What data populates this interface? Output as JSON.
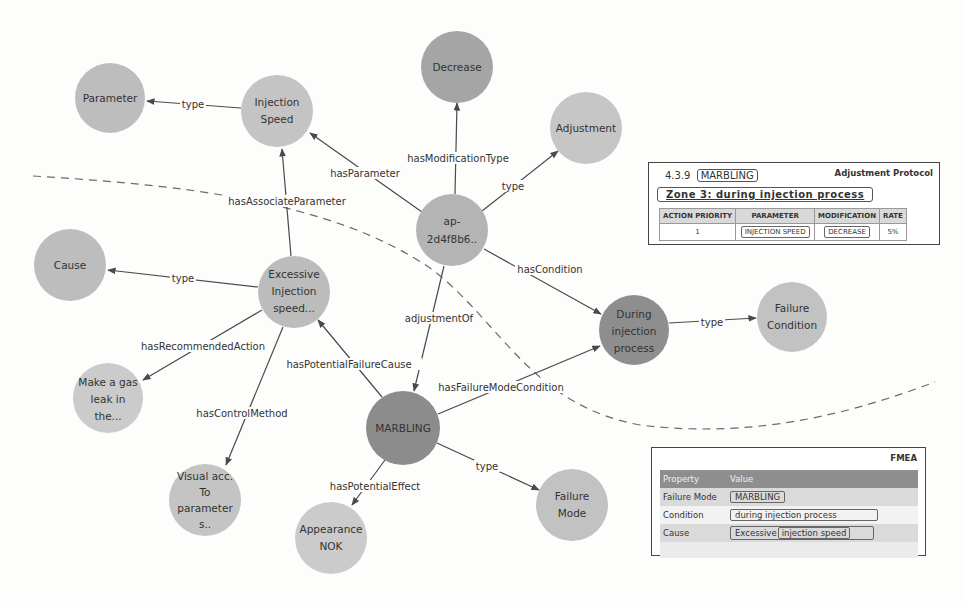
{
  "colors": {
    "node_light": "#c4c4c4",
    "node_medium": "#a9a9a9",
    "node_dark": "#8b8b8b",
    "edge": "#4a4a4a",
    "panel_header": "#8e8e8e"
  },
  "nodes": {
    "parameter": {
      "lines": [
        "Parameter"
      ]
    },
    "injection_speed": {
      "lines": [
        "Injection",
        "Speed"
      ]
    },
    "decrease": {
      "lines": [
        "Decrease"
      ]
    },
    "adjustment": {
      "lines": [
        "Adjustment"
      ]
    },
    "ap": {
      "lines": [
        "ap-",
        "2d4f8b6.."
      ]
    },
    "cause": {
      "lines": [
        "Cause"
      ]
    },
    "excessive": {
      "lines": [
        "Excessive",
        "Injection",
        "speed..."
      ]
    },
    "during": {
      "lines": [
        "During",
        "injection",
        "process"
      ]
    },
    "failure_condition": {
      "lines": [
        "Failure",
        "Condition"
      ]
    },
    "make_gas": {
      "lines": [
        "Make a gas",
        "leak in",
        "the..."
      ]
    },
    "marbling": {
      "lines": [
        "MARBLING"
      ]
    },
    "visual": {
      "lines": [
        "Visual acc.",
        "To",
        "parameter",
        "s.."
      ]
    },
    "appearance": {
      "lines": [
        "Appearance",
        "NOK"
      ]
    },
    "failure_mode": {
      "lines": [
        "Failure",
        "Mode"
      ]
    }
  },
  "edges": {
    "injspeed_type": "type",
    "ap_hasParameter": "hasParameter",
    "ap_hasModificationType": "hasModificationType",
    "ap_type": "type",
    "excessive_hasAssociateParameter": "hasAssociateParameter",
    "ap_hasCondition": "hasCondition",
    "excessive_type": "type",
    "ap_adjustmentOf": "adjustmentOf",
    "during_type": "type",
    "excessive_hasRecommendedAction": "hasRecommendedAction",
    "marbling_hasPotentialFailureCause": "hasPotentialFailureCause",
    "marbling_hasFailureModeCondition": "hasFailureModeCondition",
    "excessive_hasControlMethod": "hasControlMethod",
    "marbling_hasPotentialEffect": "hasPotentialEffect",
    "marbling_type": "type"
  },
  "adjustment_protocol": {
    "section_number": "4.3.9",
    "section_name": "MARBLING",
    "title": "Adjustment Protocol",
    "zone": "Zone  3:  during  injection  process",
    "columns": [
      "ACTION PRIORITY",
      "PARAMETER",
      "MODIFICATION",
      "RATE"
    ],
    "rows": [
      {
        "priority": "1",
        "parameter": "INJECTION SPEED",
        "modification": "DECREASE",
        "rate": "5%"
      }
    ]
  },
  "fmea": {
    "title": "FMEA",
    "header": {
      "property": "Property",
      "value": "Value"
    },
    "rows": [
      {
        "property": "Failure Mode",
        "value": "MARBLING"
      },
      {
        "property": "Condition",
        "value": "during injection process"
      },
      {
        "property": "Cause",
        "value_prefix": "Excessive",
        "value_inner": "injection speed"
      }
    ]
  }
}
